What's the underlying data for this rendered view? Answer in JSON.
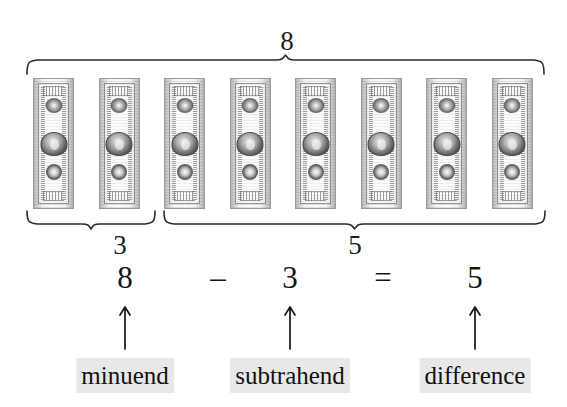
{
  "diagram": {
    "total_label": "8",
    "left_group_label": "3",
    "right_group_label": "5",
    "total_bills": 8,
    "left_group_bills": 3,
    "right_group_bills": 5,
    "bill_name": "one-dollar-bill"
  },
  "equation": {
    "minuend": "8",
    "minus_sign": "–",
    "subtrahend": "3",
    "equals_sign": "=",
    "difference": "5"
  },
  "labels": {
    "minuend": "minuend",
    "subtrahend": "subtrahend",
    "difference": "difference",
    "highlight_color": "#e8e8e8"
  },
  "colors": {
    "background": "#ffffff",
    "ink": "#1a1a1a",
    "brace_stroke": "#2b2b2b",
    "arrow_stroke": "#171717",
    "bill_gray": "#b9b9b9"
  }
}
